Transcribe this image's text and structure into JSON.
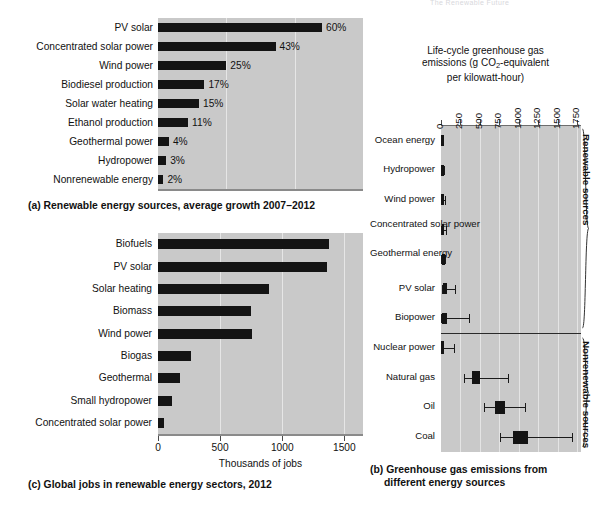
{
  "page": {
    "top_cropped_fragment": "The Renewable Future"
  },
  "panel_a": {
    "caption": "(a) Renewable energy sources, average growth 2007–2012",
    "chart_data": {
      "type": "bar",
      "orientation": "horizontal",
      "title": "Renewable energy sources, average growth 2007-2012",
      "xlabel": "",
      "ylabel": "",
      "xlim": [
        0,
        75
      ],
      "grid": true,
      "gridlines": [
        25,
        50
      ],
      "value_suffix": "%",
      "categories": [
        "PV solar",
        "Concentrated solar power",
        "Wind power",
        "Biodiesel production",
        "Solar water heating",
        "Ethanol production",
        "Geothermal power",
        "Hydropower",
        "Nonrenewable energy"
      ],
      "values": [
        60,
        43,
        25,
        17,
        15,
        11,
        4,
        3,
        2
      ],
      "value_labels": [
        "60%",
        "43%",
        "25%",
        "17%",
        "15%",
        "11%",
        "4%",
        "3%",
        "2%"
      ]
    }
  },
  "panel_c": {
    "caption": "(c) Global jobs in renewable energy sectors, 2012",
    "chart_data": {
      "type": "bar",
      "orientation": "horizontal",
      "title": "Global jobs in renewable energy sectors, 2012",
      "xlabel": "Thousands of jobs",
      "ylabel": "",
      "xlim": [
        0,
        1650
      ],
      "grid": true,
      "ticks": [
        0,
        500,
        1000,
        1500
      ],
      "tick_labels": [
        "0",
        "500",
        "1000",
        "1500"
      ],
      "categories": [
        "Biofuels",
        "PV solar",
        "Solar heating",
        "Biomass",
        "Wind power",
        "Biogas",
        "Geothermal",
        "Small hydropower",
        "Concentrated solar power"
      ],
      "values": [
        1380,
        1360,
        890,
        745,
        755,
        265,
        180,
        110,
        45
      ]
    }
  },
  "panel_b": {
    "caption_line1": "(b) Greenhouse gas emissions from",
    "caption_line2": "different energy sources",
    "axis_title_line1": "Life-cycle greenhouse gas",
    "axis_title_line2_pre": "emissions (g CO",
    "axis_title_line2_sub": "2",
    "axis_title_line2_post": "-equivalent",
    "axis_title_line3": "per kilowatt-hour)",
    "group_renewable": "Renewable sources",
    "group_nonrenewable": "Nonrenewable sources",
    "chart_data": {
      "type": "box",
      "title": "Greenhouse gas emissions from different energy sources",
      "xlabel": "Life-cycle greenhouse gas emissions (g CO2-equivalent per kilowatt-hour)",
      "ylabel": "",
      "xlim": [
        0,
        1800
      ],
      "ticks": [
        0,
        250,
        500,
        750,
        1000,
        1250,
        1500,
        1750
      ],
      "tick_labels": [
        "0",
        "250",
        "500",
        "750",
        "1000",
        "1250",
        "1500",
        "1750"
      ],
      "grid": true,
      "groups": [
        {
          "name": "Renewable sources",
          "items": [
            {
              "label": "Ocean energy",
              "low": 0,
              "q1": 0,
              "q3": 10,
              "high": 10
            },
            {
              "label": "Hydropower",
              "low": 0,
              "q1": 2,
              "q3": 10,
              "high": 40
            },
            {
              "label": "Wind power",
              "low": 0,
              "q1": 5,
              "q3": 15,
              "high": 50
            },
            {
              "label": "Concentrated solar power",
              "low": 0,
              "q1": 10,
              "q3": 25,
              "high": 60
            },
            {
              "label": "Geothermal energy",
              "low": 0,
              "q1": 15,
              "q3": 50,
              "high": 55
            },
            {
              "label": "PV solar",
              "low": 10,
              "q1": 25,
              "q3": 75,
              "high": 180
            },
            {
              "label": "Biopower",
              "low": 5,
              "q1": 15,
              "q3": 80,
              "high": 360
            }
          ]
        },
        {
          "name": "Nonrenewable sources",
          "items": [
            {
              "label": "Nuclear power",
              "low": 0,
              "q1": 5,
              "q3": 20,
              "high": 170
            },
            {
              "label": "Natural gas",
              "low": 290,
              "q1": 400,
              "q3": 500,
              "high": 860
            },
            {
              "label": "Oil",
              "low": 550,
              "q1": 690,
              "q3": 820,
              "high": 1080
            },
            {
              "label": "Coal",
              "low": 760,
              "q1": 930,
              "q3": 1120,
              "high": 1680
            }
          ]
        }
      ]
    }
  },
  "colors": {
    "plot_background": "#c9c9c9",
    "bar_fill": "#141414",
    "gridline": "#e6e6e6",
    "page_background": "#ffffff"
  }
}
